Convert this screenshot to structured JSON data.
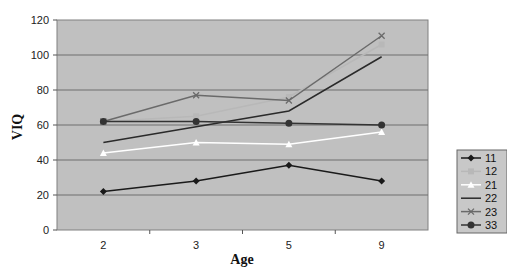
{
  "chart_data": {
    "type": "line",
    "title": "",
    "xlabel": "Age",
    "ylabel": "VIQ",
    "categories": [
      "2",
      "3",
      "5",
      "9"
    ],
    "ylim": [
      0,
      120
    ],
    "yticks": [
      0,
      20,
      40,
      60,
      80,
      100,
      120
    ],
    "grid": true,
    "legend_position": "right",
    "plot_background": "#c0c0c0",
    "series": [
      {
        "name": "11",
        "values": [
          22,
          28,
          37,
          28
        ],
        "color": "#1a1a1a",
        "marker": "diamond"
      },
      {
        "name": "12",
        "values": [
          62,
          65,
          76,
          106
        ],
        "color": "#b8b8b8",
        "marker": "square"
      },
      {
        "name": "21",
        "values": [
          44,
          50,
          49,
          56
        ],
        "color": "#ffffff",
        "marker": "triangle"
      },
      {
        "name": "22",
        "values": [
          50,
          59,
          68,
          99
        ],
        "color": "#2a2a2a",
        "marker": "none"
      },
      {
        "name": "23",
        "values": [
          62,
          77,
          74,
          111
        ],
        "color": "#6a6a6a",
        "marker": "x"
      },
      {
        "name": "33",
        "values": [
          62,
          62,
          61,
          60
        ],
        "color": "#333333",
        "marker": "circle"
      }
    ]
  }
}
